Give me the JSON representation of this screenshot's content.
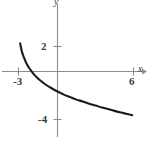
{
  "figure": {
    "kind": "cartesian-graph",
    "width": 148,
    "height": 141,
    "background": "#ffffff",
    "axis_color": "#8c8c8c",
    "curve_color": "#1a1a1a",
    "text_color": "#3a3a3a"
  },
  "labels": {
    "x_axis": "x",
    "y_axis": "y",
    "x_tick_neg3": "-3",
    "x_tick_6": "6",
    "y_tick_2": "2",
    "y_tick_neg4": "-4"
  },
  "chart_data": {
    "type": "line",
    "title": "",
    "subtitle": "",
    "xlabel": "x",
    "ylabel": "y",
    "grid": false,
    "legend": null,
    "axes": {
      "x_axis_at_y": 0,
      "y_axis_at_x": 0,
      "xlim": [
        -3.1,
        6.9
      ],
      "ylim": [
        -5.5,
        3.2
      ],
      "x_ticks": [
        -3,
        6
      ],
      "x_tick_labels": [
        "-3",
        "6"
      ],
      "y_ticks": [
        2,
        -4
      ],
      "y_tick_labels": [
        "2",
        "-4"
      ],
      "arrow_heads": [
        "x-positive"
      ]
    },
    "series": [
      {
        "name": "curve",
        "description": "decreasing concave-up logarithmic-type curve with vertical asymptote near x = -3",
        "x": [
          -2.95,
          -2.9,
          -2.8,
          -2.7,
          -2.6,
          -2.5,
          -2.4,
          -2.25,
          -2.0,
          -1.75,
          -1.5,
          -1.25,
          -1.0,
          -0.5,
          0.0,
          0.5,
          1.0,
          1.5,
          2.0,
          2.5,
          3.0,
          3.5,
          4.0,
          4.5,
          5.0,
          5.5,
          5.9
        ],
        "y": [
          2.25,
          2.0,
          1.55,
          1.25,
          1.0,
          0.75,
          0.55,
          0.3,
          -0.05,
          -0.35,
          -0.6,
          -0.8,
          -1.0,
          -1.32,
          -1.6,
          -1.85,
          -2.05,
          -2.25,
          -2.4,
          -2.58,
          -2.72,
          -2.88,
          -3.0,
          -3.15,
          -3.28,
          -3.4,
          -3.5
        ]
      }
    ],
    "annotations": []
  }
}
